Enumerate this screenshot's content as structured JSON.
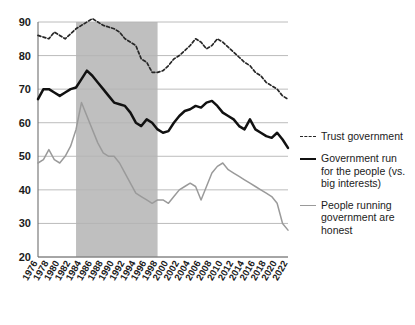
{
  "chart_data": {
    "type": "line",
    "title": "",
    "subtitle": "",
    "xlabel": "",
    "ylabel": "",
    "xlim": [
      1976,
      2022
    ],
    "ylim": [
      20,
      90
    ],
    "ytick_values": [
      20,
      30,
      40,
      50,
      60,
      70,
      80,
      90
    ],
    "ytick_labels": [
      "20",
      "30",
      "40",
      "50",
      "60",
      "70",
      "80",
      "90"
    ],
    "grid": "horizontal",
    "legend_position": "right",
    "xtick_labels": [
      "1976",
      "1978",
      "1980",
      "1982",
      "1984",
      "1986",
      "1988",
      "1990",
      "1992",
      "1994",
      "1996",
      "1998",
      "2000",
      "2002",
      "2004",
      "2006",
      "2008",
      "2010",
      "2012",
      "2014",
      "2016",
      "2018",
      "2020",
      "2022"
    ],
    "x": [
      1976,
      1977,
      1978,
      1979,
      1980,
      1981,
      1982,
      1983,
      1984,
      1985,
      1986,
      1987,
      1988,
      1989,
      1990,
      1991,
      1992,
      1993,
      1994,
      1995,
      1996,
      1997,
      1998,
      1999,
      2000,
      2001,
      2002,
      2003,
      2004,
      2005,
      2006,
      2007,
      2008,
      2009,
      2010,
      2011,
      2012,
      2013,
      2014,
      2015,
      2016,
      2017,
      2018,
      2019,
      2020,
      2021,
      2022
    ],
    "shaded_band": {
      "label": "",
      "x_start": 1983,
      "x_end": 1998,
      "color": "#bfbfbf"
    },
    "series": [
      {
        "name": "Trust government",
        "style": "dashed",
        "color": "#262626",
        "values": [
          86,
          85.5,
          85,
          87,
          86,
          85,
          86.5,
          88,
          89,
          90,
          91,
          90,
          89,
          88.5,
          88,
          87,
          85,
          84,
          83,
          79,
          78,
          75,
          75,
          75.5,
          77,
          79,
          80,
          81.5,
          83,
          85,
          84,
          82,
          83,
          85,
          84,
          82.5,
          81,
          79.5,
          78,
          77,
          75,
          74,
          72,
          71,
          70,
          68,
          67
        ]
      },
      {
        "name": "Government run for the people (vs. big interests)",
        "style": "solid",
        "color": "#111111",
        "values": [
          67,
          70,
          70,
          69,
          68,
          69,
          70,
          70.5,
          73,
          75.5,
          74,
          72,
          70,
          68,
          66,
          65.5,
          65,
          63,
          60,
          59,
          61,
          60,
          58,
          57,
          57.5,
          60,
          62,
          63.5,
          64,
          65,
          64.5,
          66,
          66.5,
          65,
          63,
          62,
          61,
          59,
          58,
          61,
          58,
          57,
          56,
          55.5,
          57,
          55,
          52.5
        ]
      },
      {
        "name": "People running government are honest",
        "style": "solid",
        "color": "#9a9a9a",
        "values": [
          48,
          49,
          52,
          49,
          48,
          50,
          53,
          58,
          66,
          62,
          58,
          54,
          51,
          50,
          50,
          48,
          45,
          42,
          39,
          38,
          37,
          36,
          37,
          37,
          36,
          38,
          40,
          41,
          42,
          41,
          37,
          41,
          45,
          47,
          48,
          46,
          45,
          44,
          43,
          42,
          41,
          40,
          39,
          38,
          36,
          30,
          28
        ]
      }
    ]
  },
  "legend": {
    "items": [
      {
        "label": "Trust government",
        "style": "dashed"
      },
      {
        "label": "Government run for the people (vs. big interests)",
        "style": "solid-black"
      },
      {
        "label": "People running government are honest",
        "style": "solid-gray"
      }
    ]
  },
  "colors": {
    "background": "#ffffff",
    "grid": "#b4b4b4",
    "axis": "#6f6f6f",
    "band": "#bfbfbf",
    "trust": "#262626",
    "for_people": "#111111",
    "honest": "#9a9a9a"
  }
}
